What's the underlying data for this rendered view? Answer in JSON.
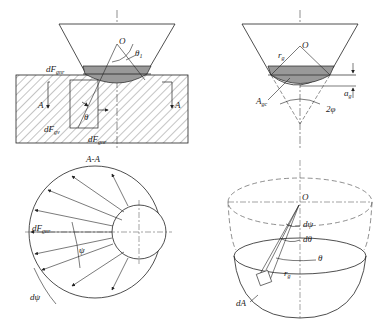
{
  "figure": {
    "panel_tl": {
      "labels": {
        "O": "O",
        "theta1": "θ",
        "theta1_sub": "1",
        "dFgnr": "dF",
        "dFgnr_sub": "gnr",
        "A_left": "A",
        "A_right": "A",
        "theta": "θ",
        "dFgv": "dF",
        "dFgv_sub": "gv",
        "dFgnr_bottom": "dF",
        "dFgnr_bottom_sub": "gnr"
      }
    },
    "panel_tr": {
      "labels": {
        "O": "O",
        "rg": "r",
        "rg_sub": "g",
        "Agc": "A",
        "Agc_sub": "gc",
        "ag": "a",
        "ag_sub": "g",
        "two_phi": "2φ"
      }
    },
    "panel_bl": {
      "section_title": "A-A",
      "labels": {
        "dFgnr": "dF",
        "dFgnr_sub": "gnr",
        "psi": "ψ",
        "dpsi": "dψ"
      }
    },
    "panel_br": {
      "labels": {
        "O": "O",
        "dpsi": "dψ",
        "dtheta": "dθ",
        "theta": "θ",
        "rg": "r",
        "rg_sub": "g",
        "dA": "dA"
      }
    }
  }
}
